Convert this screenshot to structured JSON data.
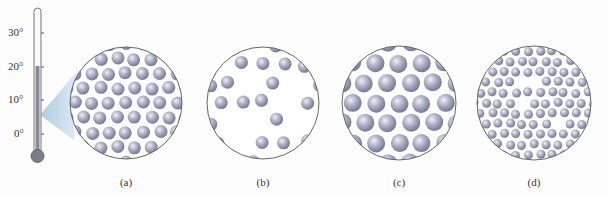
{
  "thermometer": {
    "ticks": [
      {
        "label": "30°",
        "y": 33
      },
      {
        "label": "20°",
        "y": 67
      },
      {
        "label": "10°",
        "y": 100
      },
      {
        "label": "0°",
        "y": 134
      }
    ],
    "fill_color": "#8a8a96",
    "reading": "20°"
  },
  "panels": [
    {
      "label": "(a)",
      "cx": 126,
      "cy": 103,
      "r": 56,
      "particle_r": 6.5,
      "density": "close-packed"
    },
    {
      "label": "(b)",
      "cx": 263,
      "cy": 103,
      "r": 56,
      "particle_r": 6.5,
      "density": "sparse"
    },
    {
      "label": "(c)",
      "cx": 399,
      "cy": 103,
      "r": 57,
      "particle_r": 9,
      "density": "large particles"
    },
    {
      "label": "(d)",
      "cx": 534,
      "cy": 103,
      "r": 57,
      "particle_r": 4.5,
      "density": "small dense particles"
    }
  ],
  "colors": {
    "particle": "#a9abc2",
    "particle_dark": "#7d7f99",
    "particle_light": "#e6e7f2",
    "circle_stroke": "#666666",
    "beam": "#b9d3e8"
  }
}
